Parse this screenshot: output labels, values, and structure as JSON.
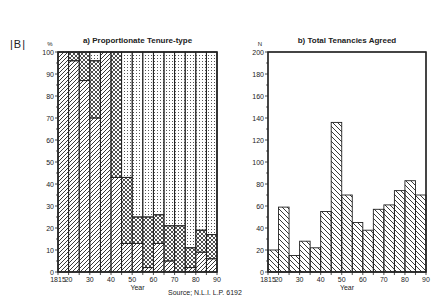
{
  "figure": {
    "panel_tag": "|B|",
    "source": "Source; N.L.I. L.P. 6192"
  },
  "chart_data": [
    {
      "type": "bar",
      "subtype": "stacked-step-histogram",
      "title": "a) Proportionate Tenure-type",
      "xlabel": "Year",
      "ylabel": "%",
      "ylim": [
        0,
        100
      ],
      "yticks": [
        0,
        10,
        20,
        30,
        40,
        50,
        60,
        70,
        80,
        90,
        100
      ],
      "xlim": [
        1815,
        1890
      ],
      "xtick_labels": [
        "1815",
        "20",
        "30",
        "40",
        "50",
        "60",
        "70",
        "80",
        "90"
      ],
      "xtick_values": [
        1815,
        1820,
        1830,
        1840,
        1850,
        1860,
        1870,
        1880,
        1890
      ],
      "bin_width": 5,
      "categories": [
        "1815-20",
        "1820-25",
        "1825-30",
        "1830-35",
        "1835-40",
        "1840-45",
        "1845-50",
        "1850-55",
        "1855-60",
        "1860-65",
        "1865-70",
        "1870-75",
        "1875-80",
        "1880-85",
        "1885-90"
      ],
      "series": [
        {
          "name": "Tenure type (diagonal hatch)",
          "pattern": "diagonal",
          "values": [
            100,
            96,
            87,
            70,
            100,
            43,
            13,
            13,
            2,
            13,
            5,
            0,
            2,
            9,
            6
          ]
        },
        {
          "name": "Tenure type (cross-hatch)",
          "pattern": "crosshatch",
          "values": [
            0,
            4,
            13,
            26,
            0,
            57,
            30,
            12,
            23,
            13,
            16,
            21,
            9,
            10,
            11
          ]
        },
        {
          "name": "Tenure type (dotted)",
          "pattern": "dots",
          "values": [
            0,
            0,
            0,
            4,
            0,
            0,
            57,
            75,
            75,
            74,
            79,
            79,
            89,
            81,
            83
          ]
        }
      ],
      "grid": false,
      "legend": "none"
    },
    {
      "type": "bar",
      "subtype": "step-histogram",
      "title": "b) Total Tenancies Agreed",
      "xlabel": "Year",
      "ylabel": "N",
      "ylim": [
        0,
        200
      ],
      "yticks": [
        0,
        20,
        40,
        60,
        80,
        100,
        120,
        140,
        160,
        180,
        200
      ],
      "xlim": [
        1815,
        1890
      ],
      "xtick_labels": [
        "1815",
        "20",
        "30",
        "40",
        "50",
        "60",
        "70",
        "80",
        "90"
      ],
      "xtick_values": [
        1815,
        1820,
        1830,
        1840,
        1850,
        1860,
        1870,
        1880,
        1890
      ],
      "bin_width": 5,
      "categories": [
        "1815-20",
        "1820-25",
        "1825-30",
        "1830-35",
        "1835-40",
        "1840-45",
        "1845-50",
        "1850-55",
        "1855-60",
        "1860-65",
        "1865-70",
        "1870-75",
        "1875-80",
        "1880-85",
        "1885-90"
      ],
      "values": [
        20,
        59,
        15,
        28,
        22,
        55,
        136,
        70,
        45,
        38,
        57,
        61,
        74,
        83,
        70
      ],
      "grid": false,
      "legend": "none"
    }
  ]
}
